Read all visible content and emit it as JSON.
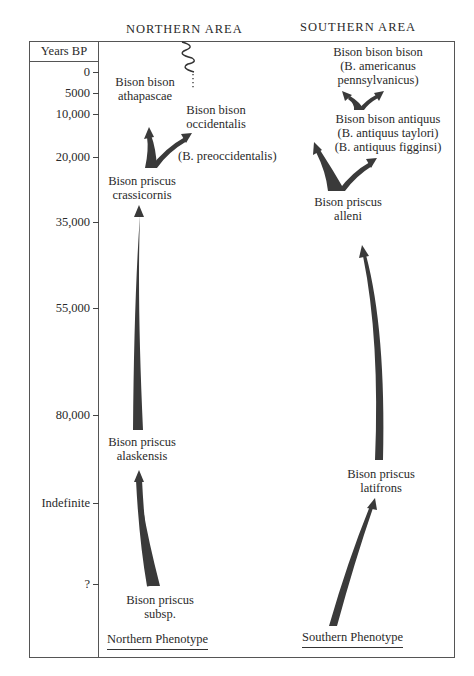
{
  "headers": {
    "northern_area": "NORTHERN AREA",
    "southern_area": "SOUTHERN AREA",
    "axis_title": "Years BP"
  },
  "axis": {
    "ticks": [
      {
        "label": "0",
        "y": 72
      },
      {
        "label": "5000",
        "y": 93
      },
      {
        "label": "10,000",
        "y": 114
      },
      {
        "label": "20,000",
        "y": 157
      },
      {
        "label": "35,000",
        "y": 222
      },
      {
        "label": "55,000",
        "y": 308
      },
      {
        "label": "80,000",
        "y": 415
      },
      {
        "label": "Indefinite",
        "y": 503
      },
      {
        "label": "?",
        "y": 584
      }
    ]
  },
  "northern": {
    "taxa": {
      "athapascae": [
        "Bison bison",
        "athapascae"
      ],
      "occidentalis": [
        "Bison bison",
        "occidentalis"
      ],
      "preoccidentalis": "(B. preoccidentalis)",
      "crassicornis": [
        "Bison priscus",
        "crassicornis"
      ],
      "alaskensis": [
        "Bison priscus",
        "alaskensis"
      ],
      "subsp": [
        "Bison priscus",
        "subsp."
      ]
    },
    "phenotype": "Northern Phenotype"
  },
  "southern": {
    "taxa": {
      "bison": [
        "Bison bison bison",
        "(B. americanus",
        "pennsylvanicus)"
      ],
      "antiquus": [
        "Bison bison antiquus",
        "(B. antiquus taylori)",
        "(B. antiquus figginsi)"
      ],
      "alleni": [
        "Bison priscus",
        "alleni"
      ],
      "latifrons": [
        "Bison priscus",
        "latifrons"
      ]
    },
    "phenotype": "Southern Phenotype"
  },
  "colors": {
    "arrow": "#3a3a3a",
    "frame": "#555555"
  }
}
